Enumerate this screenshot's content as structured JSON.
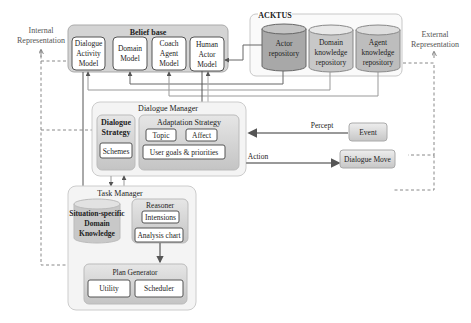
{
  "side_labels": {
    "internal": [
      "Internal",
      "Representation"
    ],
    "external": [
      "External",
      "Representation"
    ]
  },
  "belief_base": {
    "title": "Belief base",
    "models": [
      {
        "lines": [
          "Dialogue",
          "Activity",
          "Model"
        ]
      },
      {
        "lines": [
          "Domain",
          "Model"
        ]
      },
      {
        "lines": [
          "Coach",
          "Agent",
          "Model"
        ]
      },
      {
        "lines": [
          "Human",
          "Actor",
          "Model"
        ]
      }
    ]
  },
  "acktus": {
    "title": "ACKTUS",
    "repositories": [
      {
        "lines": [
          "Actor",
          "repository"
        ]
      },
      {
        "lines": [
          "Domain",
          "knowledge",
          "repository"
        ]
      },
      {
        "lines": [
          "Agent",
          "knowledge",
          "repository"
        ]
      }
    ]
  },
  "dialogue_manager": {
    "title": "Dialogue Manager",
    "dialogue_strategy": {
      "lines": [
        "Dialogue",
        "Strategy"
      ],
      "schemes": "Schemes"
    },
    "adaptation_strategy": {
      "title": "Adaptation Strategy",
      "topic": "Topic",
      "affect": "Affect",
      "goals": "User goals & priorities"
    }
  },
  "io": {
    "percept": "Percept",
    "event": "Event",
    "action": "Action",
    "dialogue_move": "Dialogue Move"
  },
  "task_manager": {
    "title": "Task Manager",
    "domain_knowledge": [
      "Situation-specific",
      "Domain",
      "Knowledge"
    ],
    "reasoner": {
      "title": "Reasoner",
      "intensions": "Intensions",
      "analysis_chart": "Analysis chart"
    },
    "plan_generator": {
      "title": "Plan Generator",
      "utility": "Utility",
      "scheduler": "Scheduler"
    }
  },
  "colors": {
    "container_fill": "#f4f4f4",
    "container_stroke": "#c8c8c8",
    "inner_fill": "#d9d9d9",
    "box_fill": "#ffffff",
    "box_stroke": "#555555",
    "cyl_dark": "#a9a9a9",
    "cyl_light": "#cfcfcf",
    "line": "#666666",
    "dashed": "#777777"
  }
}
